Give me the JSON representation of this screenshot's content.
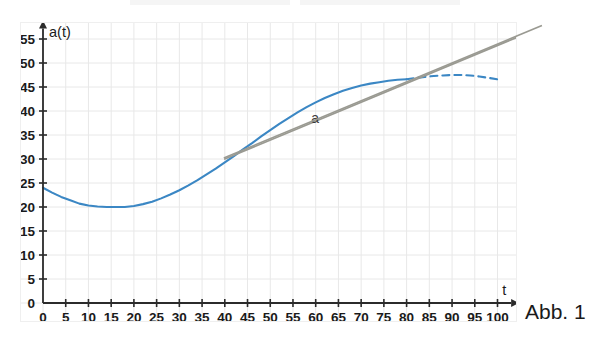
{
  "figure": {
    "caption": "Abb. 1"
  },
  "chart_data": {
    "type": "line",
    "title": "",
    "xlabel": "t",
    "ylabel": "a(t)",
    "xlim": [
      0,
      104
    ],
    "ylim": [
      0,
      58
    ],
    "grid": true,
    "legend_position": "none",
    "xticks": [
      0,
      5,
      10,
      15,
      20,
      25,
      30,
      35,
      40,
      45,
      50,
      55,
      60,
      65,
      70,
      75,
      80,
      85,
      90,
      95,
      100
    ],
    "xtick_labels": [
      "0",
      "5",
      "10",
      "15",
      "20",
      "25",
      "30",
      "35",
      "40",
      "45",
      "50",
      "55",
      "60",
      "65",
      "70",
      "75",
      "80",
      "85",
      "90",
      "95",
      "100"
    ],
    "yticks": [
      0,
      5,
      10,
      15,
      20,
      25,
      30,
      35,
      40,
      45,
      50,
      55
    ],
    "ytick_labels": [
      "0",
      "5",
      "10",
      "15",
      "20",
      "25",
      "30",
      "35",
      "40",
      "45",
      "50",
      "55"
    ],
    "annotations": [
      {
        "text": "a",
        "x": 59,
        "y": 37.5,
        "note": "label for the gray tangent line"
      }
    ],
    "series": [
      {
        "name": "a(t) solid",
        "style": "solid",
        "color": "#3b87c4",
        "x": [
          0,
          2,
          4,
          6,
          8,
          10,
          12,
          14,
          16,
          18,
          20,
          22,
          24,
          26,
          28,
          30,
          32,
          34,
          36,
          38,
          40,
          42,
          44,
          46,
          48,
          50,
          52,
          54,
          56,
          58,
          60,
          62,
          64,
          66,
          68,
          70,
          72,
          74,
          76,
          78,
          80
        ],
        "y": [
          24.0,
          23.0,
          22.1,
          21.4,
          20.7,
          20.3,
          20.1,
          20.0,
          20.0,
          20.0,
          20.2,
          20.6,
          21.1,
          21.8,
          22.6,
          23.5,
          24.5,
          25.6,
          26.8,
          28.0,
          29.3,
          30.6,
          32.0,
          33.3,
          34.7,
          36.0,
          37.3,
          38.5,
          39.7,
          40.8,
          41.8,
          42.7,
          43.5,
          44.2,
          44.8,
          45.3,
          45.7,
          46.0,
          46.3,
          46.5,
          46.6
        ]
      },
      {
        "name": "a(t) dashed extension",
        "style": "dashed",
        "color": "#3b87c4",
        "x": [
          80,
          82,
          84,
          86,
          88,
          90,
          92,
          94,
          96,
          98,
          100
        ],
        "y": [
          46.6,
          46.9,
          47.1,
          47.3,
          47.4,
          47.5,
          47.5,
          47.4,
          47.2,
          46.9,
          46.6
        ]
      },
      {
        "name": "a tangent line",
        "style": "solid",
        "color": "#9a9a92",
        "x": [
          40,
          110
        ],
        "y": [
          30.0,
          57.6
        ]
      }
    ]
  }
}
